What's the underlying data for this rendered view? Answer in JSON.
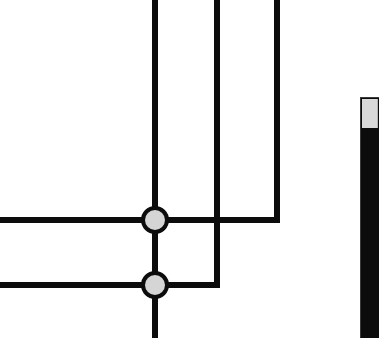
{
  "view": {
    "width": 379,
    "height": 338,
    "background": "#ffffff",
    "description": "Zoomed fragment of an orthogonal schematic diagram"
  },
  "diagram": {
    "line_color": "#0c0c0c",
    "line_width": 6,
    "node_fill": "#d5d5d5",
    "node_stroke": "#0c0c0c",
    "node_radius": 12,
    "node_stroke_width": 4,
    "nodes": [
      {
        "name": "junction-upper",
        "cx": 155,
        "cy": 220
      },
      {
        "name": "junction-lower",
        "cx": 155,
        "cy": 285
      }
    ],
    "edges": [
      {
        "name": "vertical-center-trunk",
        "x1": 155,
        "y1": 0,
        "x2": 155,
        "y2": 338
      },
      {
        "name": "vertical-middle-branch",
        "x1": 217,
        "y1": 0,
        "x2": 217,
        "y2": 285
      },
      {
        "name": "vertical-right-branch",
        "x1": 277,
        "y1": 0,
        "x2": 277,
        "y2": 220
      },
      {
        "name": "horizontal-upper-bus",
        "x1": 0,
        "y1": 220,
        "x2": 280,
        "y2": 220
      },
      {
        "name": "horizontal-lower-bus",
        "x1": 0,
        "y1": 285,
        "x2": 220,
        "y2": 285
      }
    ]
  },
  "scrollbar": {
    "name": "vertical-scrollbar",
    "orientation": "vertical",
    "track_color": "#0c0c0c",
    "thumb_color": "#d9d9d9",
    "thumb_top": 99,
    "thumb_height": 29,
    "track_top": 97,
    "track_height": 241
  }
}
